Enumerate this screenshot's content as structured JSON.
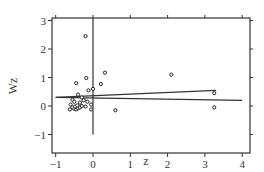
{
  "chart_data": {
    "type": "scatter",
    "title": "",
    "xlabel": "z",
    "ylabel": "Wz",
    "xlim": [
      -1.1,
      4.2
    ],
    "ylim": [
      -1.2,
      3.1
    ],
    "xticks": [
      -1,
      0,
      1,
      2,
      3,
      4
    ],
    "yticks": [
      -1,
      0,
      1,
      2,
      3
    ],
    "grid": false,
    "legend": null,
    "points": [
      {
        "x": -0.2,
        "y": 2.45
      },
      {
        "x": -0.18,
        "y": 0.98
      },
      {
        "x": 0.32,
        "y": 1.17
      },
      {
        "x": -0.45,
        "y": 0.8
      },
      {
        "x": 0.21,
        "y": 0.77
      },
      {
        "x": 0.0,
        "y": 0.6
      },
      {
        "x": -0.4,
        "y": 0.4
      },
      {
        "x": -0.3,
        "y": 0.3
      },
      {
        "x": -0.12,
        "y": 0.55
      },
      {
        "x": -0.55,
        "y": 0.22
      },
      {
        "x": -0.5,
        "y": 0.15
      },
      {
        "x": -0.35,
        "y": 0.12
      },
      {
        "x": -0.25,
        "y": 0.2
      },
      {
        "x": -0.15,
        "y": 0.15
      },
      {
        "x": -0.05,
        "y": 0.05
      },
      {
        "x": -0.6,
        "y": 0.05
      },
      {
        "x": -0.55,
        "y": -0.05
      },
      {
        "x": -0.5,
        "y": -0.1
      },
      {
        "x": -0.45,
        "y": -0.12
      },
      {
        "x": -0.4,
        "y": -0.08
      },
      {
        "x": -0.35,
        "y": -0.05
      },
      {
        "x": -0.3,
        "y": 0.0
      },
      {
        "x": -0.62,
        "y": -0.12
      },
      {
        "x": -0.48,
        "y": -0.02
      },
      {
        "x": -0.42,
        "y": 0.02
      },
      {
        "x": -0.2,
        "y": -0.02
      },
      {
        "x": -0.05,
        "y": -0.12
      },
      {
        "x": 0.6,
        "y": -0.15
      },
      {
        "x": 2.1,
        "y": 1.1
      },
      {
        "x": 3.25,
        "y": 0.45
      },
      {
        "x": 3.25,
        "y": -0.05
      }
    ],
    "lines": [
      {
        "name": "fit-rising",
        "x": [
          -1.0,
          3.3
        ],
        "y": [
          0.3,
          0.55
        ]
      },
      {
        "name": "fit-flat",
        "x": [
          -1.0,
          4.0
        ],
        "y": [
          0.3,
          0.2
        ]
      }
    ],
    "reference_lines": [
      {
        "orientation": "vertical",
        "x": 0,
        "y": [
          -1,
          3.1
        ]
      }
    ]
  }
}
